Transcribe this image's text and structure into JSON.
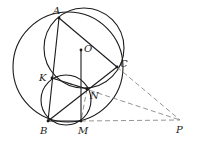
{
  "diagram": {
    "type": "geometry",
    "colors": {
      "stroke": "#1a1a1a",
      "dashed": "#888888",
      "background": "#ffffff"
    },
    "points": [
      {
        "name": "A",
        "label": "A",
        "x": 59,
        "y": 18,
        "lx": 53,
        "ly": 14
      },
      {
        "name": "O",
        "label": "O",
        "x": 81,
        "y": 50,
        "lx": 84,
        "ly": 52
      },
      {
        "name": "C",
        "label": "C",
        "x": 117,
        "y": 67,
        "lx": 120,
        "ly": 67
      },
      {
        "name": "K",
        "label": "K",
        "x": 52,
        "y": 78,
        "lx": 39,
        "ly": 81
      },
      {
        "name": "N",
        "label": "N",
        "x": 87,
        "y": 89,
        "lx": 90,
        "ly": 99
      },
      {
        "name": "B",
        "label": "B",
        "x": 48,
        "y": 121,
        "lx": 40,
        "ly": 134
      },
      {
        "name": "M",
        "label": "M",
        "x": 81,
        "y": 121,
        "lx": 78,
        "ly": 134
      },
      {
        "name": "P",
        "label": "P",
        "x": 180,
        "y": 120,
        "lx": 176,
        "ly": 133
      }
    ],
    "circles": [
      {
        "name": "circumcircle-ABC",
        "cx": 68,
        "cy": 67,
        "r": 55
      },
      {
        "name": "circle-AKNC",
        "cx": 84,
        "cy": 48,
        "r": 40
      },
      {
        "name": "circle-BKNM",
        "cx": 66,
        "cy": 100,
        "r": 25
      }
    ],
    "solid_segments": [
      [
        "A",
        "B"
      ],
      [
        "A",
        "C"
      ],
      [
        "B",
        "C"
      ],
      [
        "B",
        "M"
      ],
      [
        "O",
        "M"
      ],
      [
        "K",
        "N"
      ]
    ],
    "dashed_segments": [
      [
        "C",
        "P"
      ],
      [
        "K",
        "P"
      ],
      [
        "M",
        "P"
      ],
      [
        "N",
        "M"
      ]
    ]
  }
}
